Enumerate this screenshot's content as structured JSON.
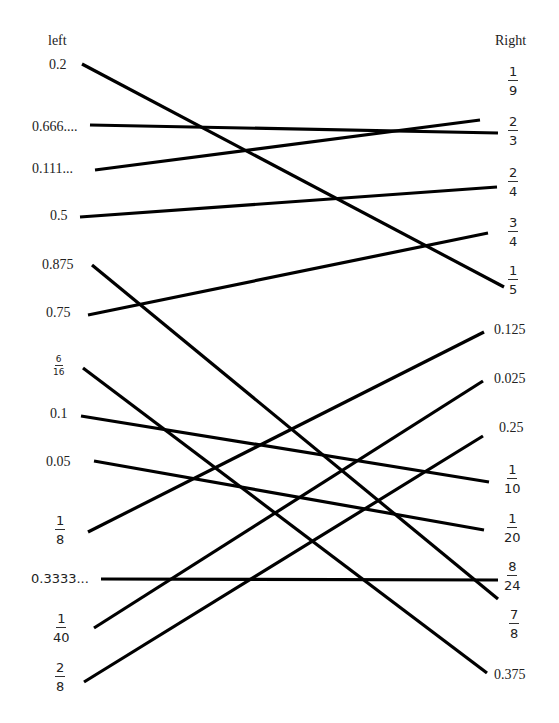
{
  "headers": {
    "left": "left",
    "right": "Right"
  },
  "left_items": [
    {
      "id": "l1",
      "text": "0.2"
    },
    {
      "id": "l2",
      "text": "0.666...."
    },
    {
      "id": "l3",
      "text": "0.111..."
    },
    {
      "id": "l4",
      "text": "0.5"
    },
    {
      "id": "l5",
      "text": "0.875"
    },
    {
      "id": "l6",
      "text": "0.75"
    },
    {
      "id": "l7",
      "num": "6",
      "den": "16"
    },
    {
      "id": "l8",
      "text": "0.1"
    },
    {
      "id": "l9",
      "text": "0.05"
    },
    {
      "id": "l10",
      "num": "1",
      "den": "8"
    },
    {
      "id": "l11",
      "text": "0.3333..."
    },
    {
      "id": "l12",
      "num": "1",
      "den": "40"
    },
    {
      "id": "l13",
      "num": "2",
      "den": "8"
    }
  ],
  "right_items": [
    {
      "id": "r1",
      "num": "1",
      "den": "9"
    },
    {
      "id": "r2",
      "num": "2",
      "den": "3"
    },
    {
      "id": "r3",
      "num": "2",
      "den": "4"
    },
    {
      "id": "r4",
      "num": "3",
      "den": "4"
    },
    {
      "id": "r5",
      "num": "1",
      "den": "5"
    },
    {
      "id": "r6",
      "text": "0.125"
    },
    {
      "id": "r7",
      "text": "0.025"
    },
    {
      "id": "r8",
      "text": "0.25"
    },
    {
      "id": "r9",
      "num": "1",
      "den": "10"
    },
    {
      "id": "r10",
      "num": "1",
      "den": "20"
    },
    {
      "id": "r11",
      "num": "8",
      "den": "24"
    },
    {
      "id": "r12",
      "num": "7",
      "den": "8"
    },
    {
      "id": "r13",
      "text": "0.375"
    }
  ],
  "connections": [
    {
      "from": "0.2",
      "to": "1/5",
      "x1": 82,
      "y1": 64,
      "x2": 504,
      "y2": 287
    },
    {
      "from": "0.666....",
      "to": "2/3",
      "x1": 90,
      "y1": 125,
      "x2": 498,
      "y2": 133
    },
    {
      "from": "0.111...",
      "to": "1/9",
      "x1": 95,
      "y1": 170,
      "x2": 480,
      "y2": 120
    },
    {
      "from": "0.5",
      "to": "2/4",
      "x1": 80,
      "y1": 217,
      "x2": 497,
      "y2": 187
    },
    {
      "from": "0.875",
      "to": "7/8",
      "x1": 92,
      "y1": 265,
      "x2": 498,
      "y2": 599
    },
    {
      "from": "0.75",
      "to": "3/4",
      "x1": 88,
      "y1": 315,
      "x2": 488,
      "y2": 233
    },
    {
      "from": "6/16",
      "to": "0.375",
      "x1": 83,
      "y1": 368,
      "x2": 487,
      "y2": 673
    },
    {
      "from": "0.1",
      "to": "1/10",
      "x1": 81,
      "y1": 416,
      "x2": 489,
      "y2": 482
    },
    {
      "from": "0.05",
      "to": "1/20",
      "x1": 94,
      "y1": 461,
      "x2": 484,
      "y2": 530
    },
    {
      "from": "1/8",
      "to": "0.125",
      "x1": 88,
      "y1": 532,
      "x2": 484,
      "y2": 332
    },
    {
      "from": "0.3333...",
      "to": "8/24",
      "x1": 101,
      "y1": 579,
      "x2": 498,
      "y2": 580
    },
    {
      "from": "1/40",
      "to": "0.025",
      "x1": 94,
      "y1": 628,
      "x2": 483,
      "y2": 381
    },
    {
      "from": "2/8",
      "to": "0.25",
      "x1": 84,
      "y1": 682,
      "x2": 483,
      "y2": 436
    }
  ]
}
